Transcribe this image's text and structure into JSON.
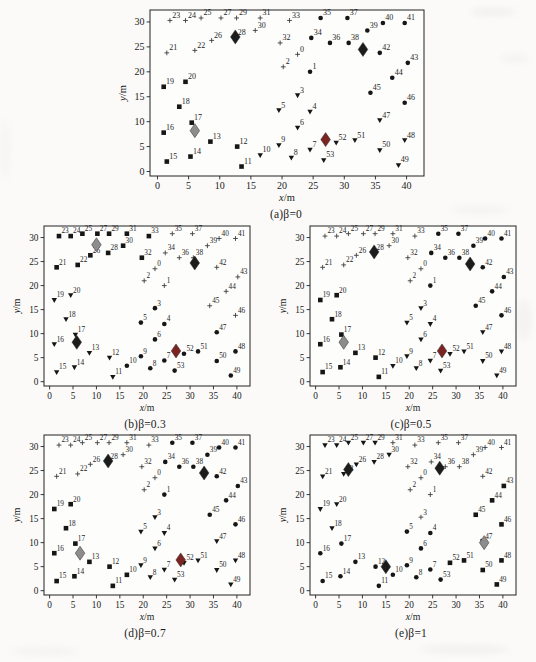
{
  "chart_data": {
    "type": "scatter",
    "axes": {
      "xlabel": "x/m",
      "ylabel": "y/m",
      "xticks": [
        0,
        5,
        10,
        15,
        20,
        25,
        30,
        35,
        40
      ],
      "yticks": [
        0,
        5,
        10,
        15,
        20,
        25,
        30
      ],
      "xlim": [
        -1.2,
        42.8
      ],
      "ylim": [
        -0.9,
        32.4
      ],
      "grid": false
    },
    "marker_colors": {
      "node": "#161616",
      "plus": "#3d3d3d",
      "black": "#1c1c1c",
      "gray": "#8d8d8d",
      "darkred": "#7c2421"
    },
    "nodes": [
      [
        0,
        22.5,
        23.5
      ],
      [
        1,
        24.5,
        20.0
      ],
      [
        2,
        20.2,
        21.0
      ],
      [
        3,
        22.5,
        15.3
      ],
      [
        4,
        24.5,
        12.0
      ],
      [
        5,
        19.5,
        12.3
      ],
      [
        6,
        22.5,
        8.8
      ],
      [
        7,
        24.5,
        4.4
      ],
      [
        8,
        21.5,
        2.8
      ],
      [
        9,
        19.5,
        5.3
      ],
      [
        10,
        16.5,
        3.3
      ],
      [
        11,
        13.5,
        1.0
      ],
      [
        12,
        12.8,
        5.0
      ],
      [
        13,
        8.5,
        6.0
      ],
      [
        14,
        5.3,
        3.0
      ],
      [
        15,
        1.5,
        2.0
      ],
      [
        16,
        1.0,
        7.8
      ],
      [
        17,
        5.5,
        9.8
      ],
      [
        18,
        3.5,
        13.0
      ],
      [
        19,
        1.0,
        17.0
      ],
      [
        20,
        4.5,
        18.0
      ],
      [
        21,
        1.5,
        23.8
      ],
      [
        22,
        6.0,
        24.3
      ],
      [
        23,
        2.0,
        30.3
      ],
      [
        24,
        4.5,
        30.3
      ],
      [
        25,
        7.0,
        30.8
      ],
      [
        26,
        8.7,
        26.3
      ],
      [
        27,
        10.2,
        30.8
      ],
      [
        28,
        12.5,
        26.8
      ],
      [
        29,
        12.7,
        30.8
      ],
      [
        30,
        15.7,
        28.3
      ],
      [
        31,
        16.5,
        30.8
      ],
      [
        32,
        19.7,
        25.8
      ],
      [
        33,
        21.2,
        30.3
      ],
      [
        34,
        24.7,
        26.8
      ],
      [
        35,
        26.2,
        30.8
      ],
      [
        36,
        27.7,
        25.8
      ],
      [
        37,
        30.5,
        30.8
      ],
      [
        38,
        30.7,
        25.8
      ],
      [
        39,
        33.7,
        28.3
      ],
      [
        40,
        36.2,
        29.8
      ],
      [
        41,
        39.7,
        29.8
      ],
      [
        42,
        35.7,
        23.8
      ],
      [
        43,
        40.2,
        21.8
      ],
      [
        44,
        37.7,
        18.8
      ],
      [
        45,
        34.2,
        15.8
      ],
      [
        46,
        39.7,
        13.8
      ],
      [
        47,
        35.7,
        10.3
      ],
      [
        48,
        39.7,
        6.3
      ],
      [
        49,
        38.7,
        1.3
      ],
      [
        50,
        35.7,
        4.3
      ],
      [
        51,
        31.7,
        6.3
      ],
      [
        52,
        28.7,
        5.8
      ],
      [
        53,
        26.7,
        2.3
      ]
    ],
    "subplots": [
      {
        "key": "a",
        "caption": "(a)β=0",
        "markers": {
          "plus": [
            0,
            2,
            21,
            22,
            23,
            24,
            25,
            26,
            27,
            28,
            29,
            30,
            31,
            32,
            33
          ],
          "circle": [
            1,
            34,
            35,
            36,
            37,
            38,
            39,
            40,
            41,
            42,
            43,
            44,
            45,
            46
          ],
          "square": [
            11,
            12,
            13,
            14,
            15,
            16,
            17,
            18,
            19,
            20
          ],
          "triangle": [
            3,
            4,
            5,
            6,
            7,
            8,
            9,
            10,
            47,
            48,
            49,
            50,
            51,
            52,
            53
          ]
        },
        "diamonds": [
          {
            "x": 12.5,
            "y": 27.0,
            "color": "black"
          },
          {
            "x": 33.0,
            "y": 24.5,
            "color": "black"
          },
          {
            "x": 6.0,
            "y": 8.2,
            "color": "gray"
          },
          {
            "x": 27.0,
            "y": 6.4,
            "color": "darkred"
          }
        ]
      },
      {
        "key": "b",
        "caption": "(b)β=0.3",
        "markers": {
          "square": [
            21,
            22,
            23,
            24,
            25,
            26,
            27,
            28,
            29,
            30,
            31,
            32,
            33
          ],
          "plus": [
            0,
            1,
            2,
            34,
            35,
            36,
            37,
            38,
            39,
            40,
            41,
            42,
            43,
            44,
            45,
            46
          ],
          "triangle": [
            11,
            12,
            13,
            14,
            15,
            16,
            17,
            18,
            19,
            20
          ],
          "circle": [
            3,
            4,
            5,
            6,
            7,
            8,
            9,
            10,
            47,
            48,
            49,
            50,
            51,
            52,
            53
          ]
        },
        "diamonds": [
          {
            "x": 10.0,
            "y": 28.5,
            "color": "gray"
          },
          {
            "x": 31.0,
            "y": 24.7,
            "color": "black"
          },
          {
            "x": 5.8,
            "y": 8.2,
            "color": "black"
          },
          {
            "x": 27.0,
            "y": 6.4,
            "color": "darkred"
          }
        ]
      },
      {
        "key": "c",
        "caption": "(c)β=0.5",
        "markers": {
          "plus": [
            0,
            2,
            21,
            22,
            23,
            24,
            25,
            26,
            27,
            28,
            29,
            30,
            31,
            32,
            33
          ],
          "circle": [
            1,
            34,
            35,
            36,
            37,
            38,
            39,
            40,
            41,
            42,
            43,
            44,
            45,
            46
          ],
          "square": [
            11,
            12,
            13,
            14,
            15,
            16,
            17,
            18,
            19,
            20
          ],
          "triangle": [
            3,
            4,
            5,
            6,
            7,
            8,
            9,
            10,
            47,
            48,
            49,
            50,
            51,
            52,
            53
          ]
        },
        "diamonds": [
          {
            "x": 12.5,
            "y": 27.0,
            "color": "black"
          },
          {
            "x": 33.0,
            "y": 24.5,
            "color": "black"
          },
          {
            "x": 6.0,
            "y": 8.2,
            "color": "gray"
          },
          {
            "x": 27.0,
            "y": 6.4,
            "color": "darkred"
          }
        ]
      },
      {
        "key": "d",
        "caption": "(d)β=0.7",
        "markers": {
          "plus": [
            0,
            2,
            21,
            22,
            23,
            24,
            25,
            26,
            27,
            28,
            29,
            30,
            31,
            32,
            33
          ],
          "circle": [
            1,
            34,
            35,
            36,
            37,
            38,
            39,
            40,
            41,
            42,
            43,
            44,
            45,
            46
          ],
          "square": [
            10,
            11,
            12,
            13,
            14,
            15,
            16,
            17,
            18,
            19,
            20
          ],
          "triangle": [
            3,
            4,
            5,
            6,
            7,
            8,
            9,
            47,
            48,
            49,
            50,
            51,
            52,
            53
          ]
        },
        "diamonds": [
          {
            "x": 12.5,
            "y": 27.0,
            "color": "black"
          },
          {
            "x": 33.0,
            "y": 24.5,
            "color": "black"
          },
          {
            "x": 6.5,
            "y": 7.8,
            "color": "gray"
          },
          {
            "x": 28.0,
            "y": 6.4,
            "color": "darkred"
          }
        ]
      },
      {
        "key": "e",
        "caption": "(e)β=1",
        "markers": {
          "plus": [
            0,
            1,
            2,
            3,
            31,
            32,
            33,
            34,
            35,
            36,
            37,
            38,
            39,
            40,
            41,
            42
          ],
          "circle": [
            4,
            5,
            6,
            7,
            8,
            9,
            10,
            11,
            12,
            13,
            14,
            15,
            16,
            17,
            53
          ],
          "triangle": [
            18,
            19,
            20,
            21,
            22,
            23,
            24,
            25,
            26,
            27,
            28,
            29,
            30
          ],
          "square": [
            43,
            44,
            45,
            46,
            47,
            48,
            49,
            50,
            51,
            52
          ]
        },
        "diamonds": [
          {
            "x": 7.0,
            "y": 25.2,
            "color": "black"
          },
          {
            "x": 26.5,
            "y": 25.5,
            "color": "black"
          },
          {
            "x": 15.0,
            "y": 5.0,
            "color": "black"
          },
          {
            "x": 36.0,
            "y": 10.0,
            "color": "gray"
          }
        ]
      }
    ]
  }
}
